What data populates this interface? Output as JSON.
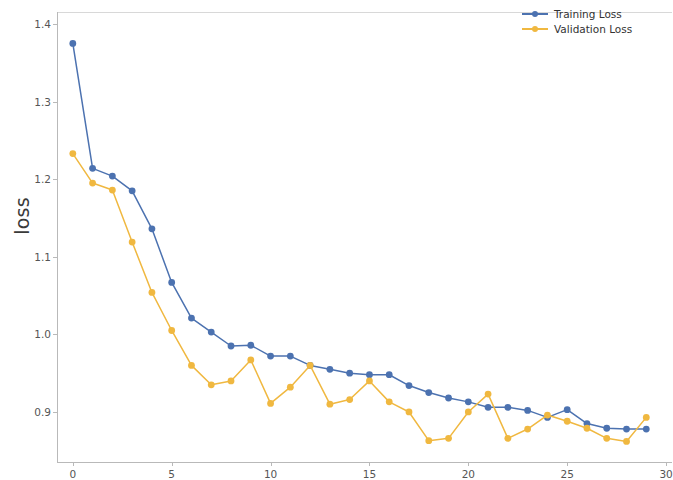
{
  "chart_data": {
    "type": "line",
    "title": "",
    "xlabel": "",
    "ylabel": "loss",
    "xlim": [
      -0.8,
      30.3
    ],
    "ylim": [
      0.8355,
      1.4155
    ],
    "grid": false,
    "legend_position": "upper right",
    "x": [
      0,
      1,
      2,
      3,
      4,
      5,
      6,
      7,
      8,
      9,
      10,
      11,
      12,
      13,
      14,
      15,
      16,
      17,
      18,
      19,
      20,
      21,
      22,
      23,
      24,
      25,
      26,
      27,
      28,
      29
    ],
    "series": [
      {
        "name": "Training Loss",
        "color": "#4c72b0",
        "values": [
          1.375,
          1.214,
          1.204,
          1.185,
          1.136,
          1.067,
          1.021,
          1.003,
          0.985,
          0.986,
          0.972,
          0.972,
          0.96,
          0.955,
          0.95,
          0.948,
          0.948,
          0.934,
          0.925,
          0.918,
          0.913,
          0.906,
          0.906,
          0.902,
          0.893,
          0.903,
          0.885,
          0.879,
          0.878,
          0.878
        ]
      },
      {
        "name": "Validation Loss",
        "color": "#f0b840",
        "values": [
          1.233,
          1.195,
          1.186,
          1.119,
          1.054,
          1.005,
          0.96,
          0.935,
          0.94,
          0.967,
          0.911,
          0.932,
          0.96,
          0.91,
          0.916,
          0.94,
          0.913,
          0.9,
          0.863,
          0.866,
          0.9,
          0.923,
          0.866,
          0.878,
          0.896,
          0.888,
          0.879,
          0.866,
          0.862,
          0.893
        ]
      }
    ],
    "x_ticks": [
      {
        "value": 0,
        "label": "0"
      },
      {
        "value": 5,
        "label": "5"
      },
      {
        "value": 10,
        "label": "10"
      },
      {
        "value": 15,
        "label": "15"
      },
      {
        "value": 20,
        "label": "20"
      },
      {
        "value": 25,
        "label": "25"
      },
      {
        "value": 30,
        "label": "30"
      }
    ],
    "y_ticks": [
      {
        "value": 1.4,
        "label": "1.4"
      },
      {
        "value": 1.3,
        "label": "1.3"
      },
      {
        "value": 1.2,
        "label": "1.2"
      },
      {
        "value": 1.1,
        "label": "1.1"
      },
      {
        "value": 1.0,
        "label": "1.0"
      },
      {
        "value": 0.9,
        "label": "0.9"
      }
    ],
    "legend": [
      {
        "label": "Training Loss",
        "color": "#4c72b0"
      },
      {
        "label": "Validation Loss",
        "color": "#f0b840"
      }
    ]
  }
}
